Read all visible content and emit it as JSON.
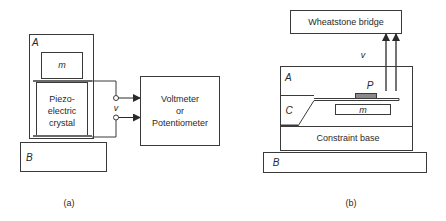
{
  "panel_a": {
    "caption": "(a)",
    "housing_label": "A",
    "mass_label": "m",
    "crystal_label_lines": [
      "Piezo-",
      "electric",
      "crystal"
    ],
    "voltage_label": "v",
    "meter_label_lines": [
      "Voltmeter",
      "or",
      "Potentiometer"
    ],
    "base_label": "B"
  },
  "panel_b": {
    "caption": "(b)",
    "bridge_label": "Wheatstone bridge",
    "voltage_label": "v",
    "housing_label": "A",
    "gauge_label": "P",
    "cantilever_label": "C",
    "mass_label": "m",
    "constraint_label": "Constraint base",
    "base_label": "B"
  },
  "colors": {
    "line": "#3a3a3a",
    "gauge_fill": "#8a8a8a",
    "plate_fill": "#6a6a6a"
  }
}
